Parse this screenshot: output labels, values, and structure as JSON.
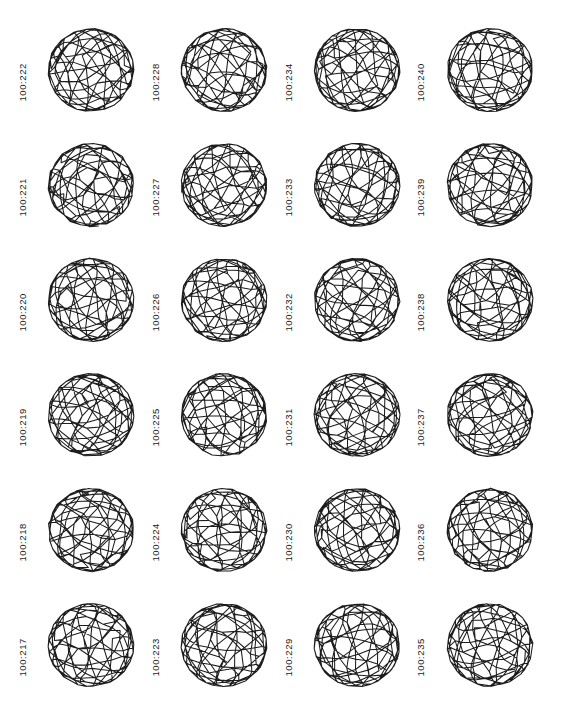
{
  "figure": {
    "kind": "fullerene-isomer-plate",
    "columns": 4,
    "rows": 6,
    "background_color": "#ffffff",
    "stroke_color": "#1c1c1c"
  },
  "cells": [
    {
      "label": "100:222",
      "column": 1,
      "row": 1,
      "seed": 222
    },
    {
      "label": "100:228",
      "column": 2,
      "row": 1,
      "seed": 228
    },
    {
      "label": "100:234",
      "column": 3,
      "row": 1,
      "seed": 234
    },
    {
      "label": "100:240",
      "column": 4,
      "row": 1,
      "seed": 240
    },
    {
      "label": "100:221",
      "column": 1,
      "row": 2,
      "seed": 221
    },
    {
      "label": "100:227",
      "column": 2,
      "row": 2,
      "seed": 227
    },
    {
      "label": "100:233",
      "column": 3,
      "row": 2,
      "seed": 233
    },
    {
      "label": "100:239",
      "column": 4,
      "row": 2,
      "seed": 239
    },
    {
      "label": "100:220",
      "column": 1,
      "row": 3,
      "seed": 220
    },
    {
      "label": "100:226",
      "column": 2,
      "row": 3,
      "seed": 226
    },
    {
      "label": "100:232",
      "column": 3,
      "row": 3,
      "seed": 232
    },
    {
      "label": "100:238",
      "column": 4,
      "row": 3,
      "seed": 238
    },
    {
      "label": "100:219",
      "column": 1,
      "row": 4,
      "seed": 219
    },
    {
      "label": "100:225",
      "column": 2,
      "row": 4,
      "seed": 225
    },
    {
      "label": "100:231",
      "column": 3,
      "row": 4,
      "seed": 231
    },
    {
      "label": "100:237",
      "column": 4,
      "row": 4,
      "seed": 237
    },
    {
      "label": "100:218",
      "column": 1,
      "row": 5,
      "seed": 218
    },
    {
      "label": "100:224",
      "column": 2,
      "row": 5,
      "seed": 224
    },
    {
      "label": "100:230",
      "column": 3,
      "row": 5,
      "seed": 230
    },
    {
      "label": "100:236",
      "column": 4,
      "row": 5,
      "seed": 236
    },
    {
      "label": "100:217",
      "column": 1,
      "row": 6,
      "seed": 217
    },
    {
      "label": "100:223",
      "column": 2,
      "row": 6,
      "seed": 223
    },
    {
      "label": "100:229",
      "column": 3,
      "row": 6,
      "seed": 229
    },
    {
      "label": "100:235",
      "column": 4,
      "row": 6,
      "seed": 235
    }
  ]
}
